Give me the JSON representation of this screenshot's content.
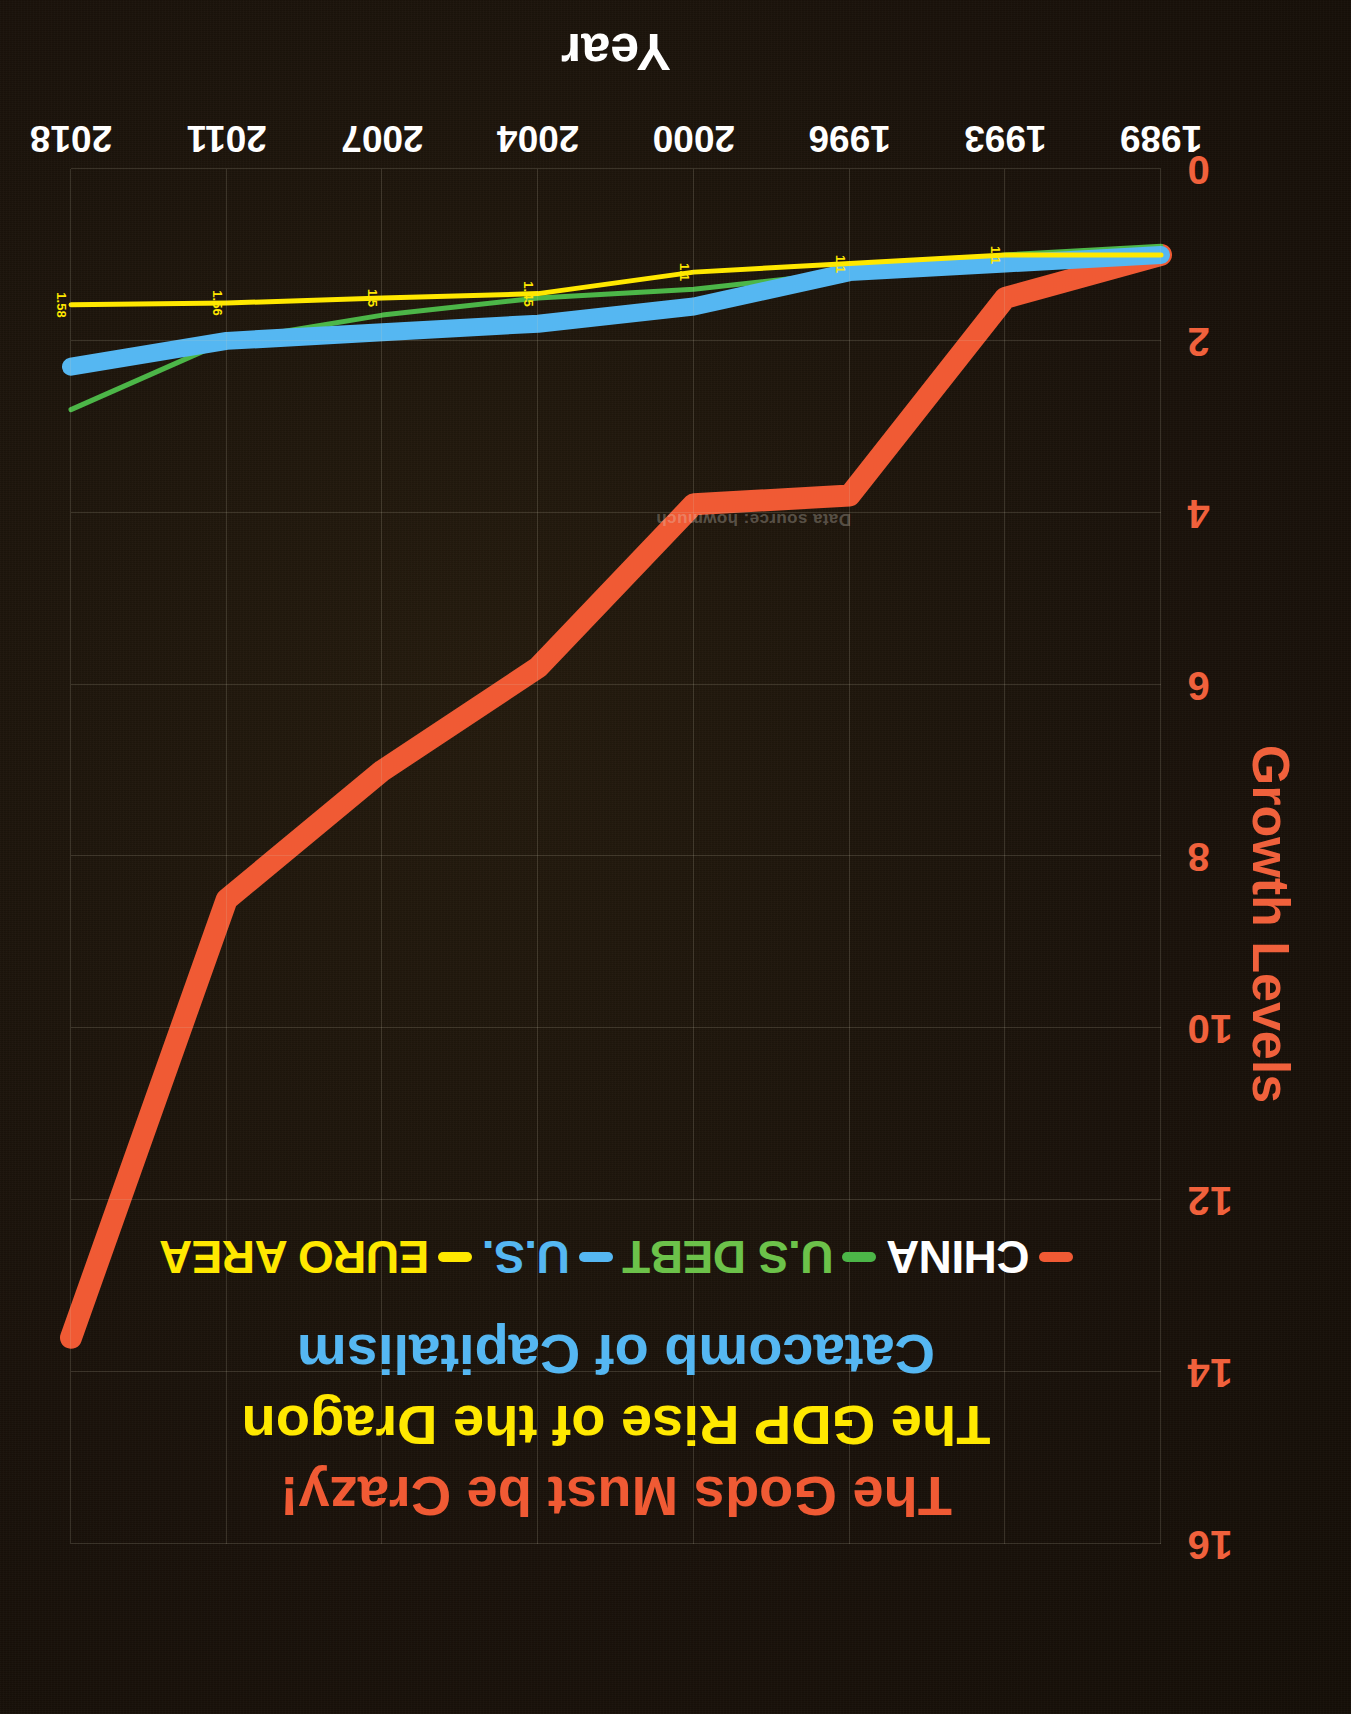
{
  "meta": {
    "orientation_note": "photographed chart displayed rotated 180 degrees",
    "background_color": "#1c1409"
  },
  "titles": {
    "line1": "The Gods Must be Crazy!",
    "line1_color": "#f05a34",
    "line2": "The GDP Rise of the Dragon",
    "line2_color": "#ffe800",
    "line3": "Catacomb of Capitalism",
    "line3_color": "#55b7f2"
  },
  "legend": {
    "items": [
      {
        "label": "CHINA",
        "color": "#f05a34",
        "text_color": "#ffffff"
      },
      {
        "label": "U.S DEBT",
        "color": "#4cb648",
        "text_color": "#6cc24a"
      },
      {
        "label": "U.S.",
        "color": "#55b7f2",
        "text_color": "#55b7f2"
      },
      {
        "label": "EURO AREA",
        "color": "#ffe800",
        "text_color": "#ffe800"
      }
    ]
  },
  "watermark": "Data source: howmuch",
  "chart_data": {
    "type": "line",
    "title": "The GDP Rise of the Dragon",
    "xlabel": "Year",
    "ylabel": "Growth Levels",
    "x": [
      "1989",
      "1993",
      "1996",
      "2000",
      "2004",
      "2007",
      "2011",
      "2018"
    ],
    "xticklabels": [
      "1989",
      "1993",
      "1996",
      "2000",
      "2004",
      "2007",
      "2011",
      "2018"
    ],
    "yticklabels": [
      "0",
      "2",
      "4",
      "6",
      "8",
      "10",
      "12",
      "14",
      "16"
    ],
    "yticks": [
      0,
      2,
      4,
      6,
      8,
      10,
      12,
      14,
      16
    ],
    "ylim": [
      0,
      16
    ],
    "grid": true,
    "legend_position": "top-center",
    "series": [
      {
        "name": "CHINA",
        "color": "#f05a34",
        "width": 22,
        "values": [
          1.0,
          1.5,
          3.8,
          3.9,
          5.8,
          7.0,
          8.5,
          13.6
        ]
      },
      {
        "name": "U.S DEBT",
        "color": "#4cb648",
        "width": 5,
        "values": [
          0.9,
          1.0,
          1.2,
          1.4,
          1.5,
          1.7,
          2.0,
          2.8
        ],
        "point_labels": [
          "",
          "",
          "",
          "",
          "",
          "",
          "",
          ""
        ]
      },
      {
        "name": "U.S.",
        "color": "#55b7f2",
        "width": 18,
        "values": [
          1.0,
          1.1,
          1.2,
          1.6,
          1.8,
          1.9,
          2.0,
          2.3
        ]
      },
      {
        "name": "EURO AREA",
        "color": "#ffe800",
        "width": 5,
        "values": [
          1.0,
          1.0,
          1.1,
          1.2,
          1.45,
          1.5,
          1.56,
          1.58
        ],
        "point_labels": [
          "",
          "1.1",
          "1.1",
          "1.1",
          "1.45",
          "1.5",
          "1.56",
          "1.58"
        ]
      }
    ]
  }
}
